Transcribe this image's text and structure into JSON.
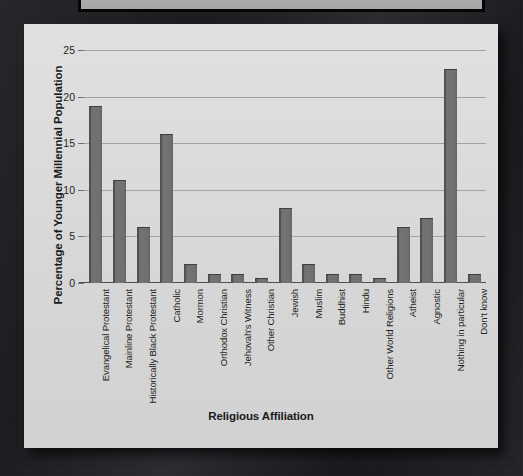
{
  "chart_data": {
    "type": "bar",
    "title": "",
    "xlabel": "Religious Affiliation",
    "ylabel": "Percentage of Younger Millennial Population",
    "ylim": [
      0,
      25
    ],
    "yticks": [
      0,
      5,
      10,
      15,
      20,
      25
    ],
    "grid": true,
    "legend": "none",
    "bar_color": "#6e7072",
    "plot_background": "#dcdcdc",
    "categories": [
      "Evangelical Protestant",
      "Mainline Protestant",
      "Historically Black Protestant",
      "Catholic",
      "Mormon",
      "Orthodox Christian",
      "Jehovah's Witness",
      "Other Christian",
      "Jewish",
      "Muslim",
      "Buddhist",
      "Hindu",
      "Other World Religions",
      "Atheist",
      "Agnostic",
      "Nothing in particular",
      "Don't know"
    ],
    "values": [
      19,
      11,
      6,
      16,
      2,
      1,
      1,
      0.5,
      8,
      2,
      1,
      1,
      0.5,
      6,
      7,
      23,
      1
    ]
  },
  "figure": {
    "background_color": "#dcdcdc"
  },
  "backdrop": {
    "color": "#1d1e21"
  }
}
